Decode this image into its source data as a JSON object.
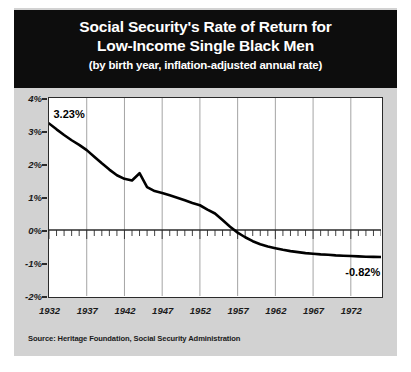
{
  "card": {
    "background_color": "#d2d2d2",
    "banner_color": "#0d0d0d"
  },
  "title": {
    "line1": "Social Security's Rate of Return for",
    "line2": "Low-Income Single Black Men",
    "line3": "(by birth year, inflation-adjusted annual rate)"
  },
  "source": "Source: Heritage Foundation, Social Security Administration",
  "annotations": {
    "start_label": "3.23%",
    "end_label": "-0.82%"
  },
  "chart_data": {
    "type": "line",
    "title": "Social Security's Rate of Return for Low-Income Single Black Men",
    "subtitle": "(by birth year, inflation-adjusted annual rate)",
    "xlabel": "",
    "ylabel": "",
    "xlim": [
      1932,
      1976
    ],
    "ylim": [
      -2,
      4
    ],
    "ytick_labels": [
      "4%",
      "3%",
      "2%",
      "1%",
      "0%",
      "-1%",
      "-2%"
    ],
    "ytick_values": [
      4,
      3,
      2,
      1,
      0,
      -1,
      -2
    ],
    "xtick_labels": [
      "1932",
      "1937",
      "1942",
      "1947",
      "1952",
      "1957",
      "1962",
      "1967",
      "1972"
    ],
    "xtick_values": [
      1932,
      1937,
      1942,
      1947,
      1952,
      1957,
      1962,
      1967,
      1972
    ],
    "grid": "vertical-every-5-years",
    "legend": "none",
    "line_color": "#000000",
    "series": [
      {
        "name": "Rate of return",
        "x": [
          1932,
          1933,
          1934,
          1935,
          1936,
          1937,
          1938,
          1939,
          1940,
          1941,
          1942,
          1943,
          1944,
          1945,
          1946,
          1947,
          1948,
          1949,
          1950,
          1951,
          1952,
          1953,
          1954,
          1955,
          1956,
          1957,
          1958,
          1959,
          1960,
          1961,
          1962,
          1963,
          1964,
          1965,
          1966,
          1967,
          1968,
          1969,
          1970,
          1971,
          1972,
          1973,
          1974,
          1975,
          1976
        ],
        "values": [
          3.23,
          3.05,
          2.88,
          2.72,
          2.58,
          2.42,
          2.22,
          2.02,
          1.83,
          1.66,
          1.55,
          1.5,
          1.72,
          1.3,
          1.18,
          1.12,
          1.05,
          0.98,
          0.9,
          0.82,
          0.75,
          0.62,
          0.5,
          0.3,
          0.1,
          -0.08,
          -0.22,
          -0.34,
          -0.43,
          -0.5,
          -0.55,
          -0.6,
          -0.64,
          -0.67,
          -0.7,
          -0.72,
          -0.74,
          -0.75,
          -0.77,
          -0.78,
          -0.79,
          -0.8,
          -0.81,
          -0.815,
          -0.82
        ]
      }
    ],
    "annotations": [
      {
        "text": "3.23%",
        "x": 1932,
        "y": 3.23
      },
      {
        "text": "-0.82%",
        "x": 1972,
        "y": -0.82
      }
    ]
  }
}
